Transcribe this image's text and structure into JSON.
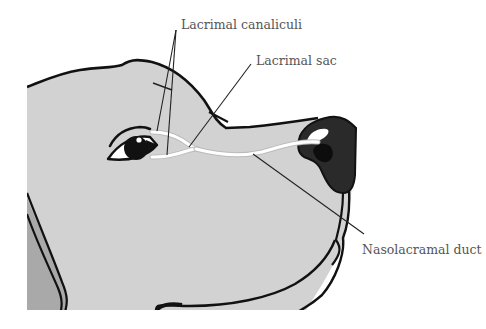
{
  "diagram": {
    "labels": {
      "lacrimal_canaliculi": "Lacrimal canaliculi",
      "lacrimal_sac": "Lacrimal sac",
      "nasolacrimal_duct": "Nasolacramal duct"
    },
    "colors": {
      "skin": "#d2d2d2",
      "ear": "#a9a9a9",
      "outline": "#111111",
      "nose": "#2a2a2a",
      "duct": "#ffffff",
      "leader_line": "#222222",
      "label_text": "#555555"
    }
  }
}
